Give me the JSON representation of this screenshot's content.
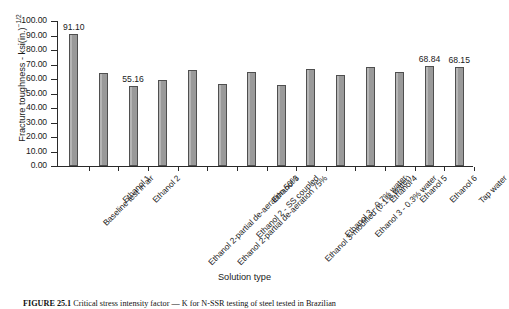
{
  "chart_data": {
    "type": "bar",
    "title": "",
    "xlabel": "Solution type",
    "ylabel": "Fracture toughness - ksi(in.)",
    "ylabel_exponent": "−1/2",
    "ylim": [
      0,
      100
    ],
    "ytick_step": 10,
    "ytick_labels": [
      "100.00",
      "90.00",
      "80.00",
      "70.00",
      "60.00",
      "50.00",
      "40.00",
      "30.00",
      "20.00",
      "10.00",
      "0.00"
    ],
    "grid": false,
    "legend": "none",
    "bar_color": "#9d9d9d",
    "bar_edge_color": "#4f4f4f",
    "categories": [
      "Baseline test in air",
      "Ethanol 1",
      "Ethanol 2",
      "Ethanol 2-partial de-aeration 50%",
      "Ethanol 2-partial de-aeration 75%",
      "Ethanol 2 - SS coupled",
      "Ethanol 3",
      "Ethanol 3-modified (0.1% water)",
      "Ethanol 3 - 0.7% water",
      "Ethanol 3 - 0.3% water",
      "Ethanol 4",
      "Ethanol 5",
      "Ethanol 6",
      "Tap water"
    ],
    "values": [
      91.1,
      64.4,
      55.16,
      59.4,
      66.0,
      56.6,
      64.6,
      56.2,
      66.7,
      62.6,
      68.1,
      64.9,
      68.84,
      68.15
    ],
    "data_labels": [
      {
        "index": 0,
        "text": "91.10"
      },
      {
        "index": 2,
        "text": "55.16"
      },
      {
        "index": 12,
        "text": "68.84"
      },
      {
        "index": 13,
        "text": "68.15"
      }
    ]
  },
  "caption": {
    "number": "FIGURE 25.1",
    "text": "Critical stress intensity factor — K for N-SSR testing of steel tested in Brazilian"
  }
}
